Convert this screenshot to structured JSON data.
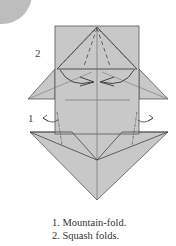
{
  "diagram": {
    "step_labels": {
      "step1": "1",
      "step2": "2"
    },
    "colors": {
      "paper": "#c8c8c8",
      "line": "#555555",
      "circle": "#bdbdbd"
    }
  },
  "caption": {
    "lines": [
      "1. Mountain-fold.",
      "2. Squash folds."
    ]
  }
}
